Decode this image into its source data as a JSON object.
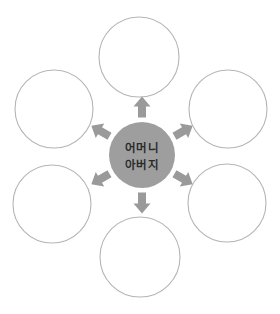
{
  "diagram": {
    "type": "radial-hub-and-spoke",
    "title": "",
    "background_color": "#ffffff",
    "center": {
      "name": "center-node",
      "label_line_1": "어머니",
      "label_line_2": "아버지",
      "fill_color": "#9e9e9e",
      "text_color": "#2b2b2b",
      "cx": 142,
      "cy": 155,
      "r": 33
    },
    "outer_nodes": [
      {
        "name": "outer-node-top",
        "label": "",
        "cx": 139,
        "cy": 57,
        "r": 40,
        "stroke_color": "#b5b5b5",
        "fill_color": "#ffffff"
      },
      {
        "name": "outer-node-top-left",
        "label": "",
        "cx": 54,
        "cy": 109,
        "r": 39,
        "stroke_color": "#b5b5b5",
        "fill_color": "#ffffff"
      },
      {
        "name": "outer-node-top-right",
        "label": "",
        "cx": 228,
        "cy": 109,
        "r": 39,
        "stroke_color": "#b5b5b5",
        "fill_color": "#ffffff"
      },
      {
        "name": "outer-node-bottom-left",
        "label": "",
        "cx": 52,
        "cy": 204,
        "r": 39,
        "stroke_color": "#b5b5b5",
        "fill_color": "#ffffff"
      },
      {
        "name": "outer-node-bottom-right",
        "label": "",
        "cx": 227,
        "cy": 203,
        "r": 39,
        "stroke_color": "#b5b5b5",
        "fill_color": "#ffffff"
      },
      {
        "name": "outer-node-bottom",
        "label": "",
        "cx": 140,
        "cy": 257,
        "r": 40,
        "stroke_color": "#b5b5b5",
        "fill_color": "#ffffff"
      }
    ],
    "arrows": [
      {
        "name": "arrow-up",
        "direction": "up",
        "angle_deg": -90,
        "color": "#9a9a9a"
      },
      {
        "name": "arrow-up-left",
        "direction": "up-left",
        "angle_deg": -150,
        "color": "#9a9a9a"
      },
      {
        "name": "arrow-up-right",
        "direction": "up-right",
        "angle_deg": -30,
        "color": "#9a9a9a"
      },
      {
        "name": "arrow-down-left",
        "direction": "down-left",
        "angle_deg": 150,
        "color": "#9a9a9a"
      },
      {
        "name": "arrow-down-right",
        "direction": "down-right",
        "angle_deg": 30,
        "color": "#9a9a9a"
      },
      {
        "name": "arrow-down",
        "direction": "down",
        "angle_deg": 90,
        "color": "#9a9a9a"
      }
    ]
  }
}
